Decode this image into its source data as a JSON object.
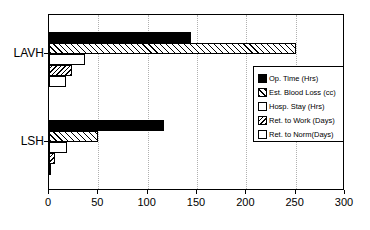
{
  "chart_data": {
    "type": "bar",
    "orientation": "horizontal",
    "title": "",
    "xlabel": "",
    "ylabel": "",
    "xlim": [
      0,
      300
    ],
    "xticks": [
      0,
      50,
      100,
      150,
      200,
      250,
      300
    ],
    "grid": "vertical-dotted",
    "legend_position": "right-middle",
    "categories": [
      "LAVH",
      "LSH"
    ],
    "series": [
      {
        "name": "Op. Time (Hrs)",
        "pattern": "solid-black",
        "values": [
          144,
          117
        ]
      },
      {
        "name": "Est. Blood Loss (cc)",
        "pattern": "forward-hatch",
        "values": [
          250,
          50
        ]
      },
      {
        "name": "Hosp. Stay (Hrs)",
        "pattern": "blank-white",
        "values": [
          36,
          18
        ]
      },
      {
        "name": "Ret. to Work (Days)",
        "pattern": "back-hatch",
        "values": [
          23,
          6
        ]
      },
      {
        "name": "Ret. to Norm(Days)",
        "pattern": "blank-white",
        "values": [
          17,
          2
        ]
      }
    ]
  },
  "axis": {
    "tick_labels": [
      "0",
      "50",
      "100",
      "150",
      "200",
      "250",
      "300"
    ]
  },
  "groups": {
    "labels": [
      "LAVH",
      "LSH"
    ]
  },
  "legend": {
    "items": [
      {
        "label": "Op. Time (Hrs)"
      },
      {
        "label": "Est. Blood Loss (cc)"
      },
      {
        "label": "Hosp. Stay (Hrs)"
      },
      {
        "label": "Ret. to Work (Days)"
      },
      {
        "label": "Ret. to Norm(Days)"
      }
    ]
  },
  "colors": {
    "ink": "#000000",
    "background": "#ffffff",
    "gridline": "#b0b0b0"
  }
}
